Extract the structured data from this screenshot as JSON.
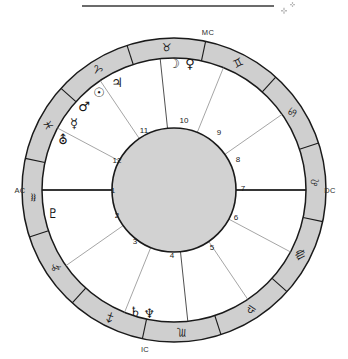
{
  "header": {
    "rule_line": "horizontal-rule",
    "marks": [
      "+",
      "+"
    ]
  },
  "chart_data": {
    "type": "pie",
    "subtitle": "",
    "xlabel": "",
    "ylabel": "",
    "legend_position": "none",
    "grid": false,
    "center": {
      "cx": 174,
      "cy": 190
    },
    "radii": {
      "outer": 152,
      "inner_ring": 132,
      "disc": 62
    },
    "colors": {
      "ring_fill": "#cfcfcf",
      "disc_fill": "#d2d2d2",
      "stroke": "#1a1a1a",
      "cusp": "#3c3c3c",
      "text": "#1a1a1a"
    },
    "categories": [
      "Aries",
      "Taurus",
      "Gemini",
      "Cancer",
      "Leo",
      "Virgo",
      "Libra",
      "Scorpio",
      "Sagittarius",
      "Capricorn",
      "Aquarius",
      "Pisces"
    ],
    "values": [
      30,
      30,
      30,
      30,
      30,
      30,
      30,
      30,
      30,
      30,
      30,
      30
    ],
    "zodiac": [
      {
        "name": "Aries",
        "glyph": "♈",
        "mid_deg": 57,
        "label_r": 142
      },
      {
        "name": "Taurus",
        "glyph": "♉",
        "mid_deg": 87,
        "label_r": 142
      },
      {
        "name": "Gemini",
        "glyph": "♊",
        "mid_deg": 117,
        "label_r": 142
      },
      {
        "name": "Cancer",
        "glyph": "♋",
        "mid_deg": 147,
        "label_r": 142
      },
      {
        "name": "Leo",
        "glyph": "♌",
        "mid_deg": 177,
        "label_r": 142
      },
      {
        "name": "Virgo",
        "glyph": "♍",
        "mid_deg": 207,
        "label_r": 142
      },
      {
        "name": "Libra",
        "glyph": "♎",
        "mid_deg": 237,
        "label_r": 142
      },
      {
        "name": "Scorpio",
        "glyph": "♏",
        "mid_deg": 267,
        "label_r": 142
      },
      {
        "name": "Sagittarius",
        "glyph": "♐",
        "mid_deg": 297,
        "label_r": 142
      },
      {
        "name": "Capricorn",
        "glyph": "♑",
        "mid_deg": 327,
        "label_r": 142
      },
      {
        "name": "Aquarius",
        "glyph": "♒",
        "mid_deg": 357,
        "label_r": 142
      },
      {
        "name": "Pisces",
        "glyph": "♓",
        "mid_deg": 27,
        "label_r": 142
      }
    ],
    "sign_boundaries_deg": [
      12,
      42,
      72,
      102,
      132,
      162,
      192,
      222,
      252,
      282,
      312,
      342
    ],
    "planets": [
      {
        "name": "Moon",
        "glyph": "☽",
        "x": 174,
        "y": 64
      },
      {
        "name": "Venus",
        "glyph": "♀",
        "x": 190,
        "y": 64
      },
      {
        "name": "Jupiter",
        "glyph": "♃",
        "x": 117,
        "y": 83
      },
      {
        "name": "Sun",
        "glyph": "☉",
        "x": 99,
        "y": 93
      },
      {
        "name": "Mars",
        "glyph": "♂",
        "x": 84,
        "y": 107
      },
      {
        "name": "Mercury",
        "glyph": "☿",
        "x": 74,
        "y": 124
      },
      {
        "name": "Uranus",
        "glyph": "⛢",
        "x": 63,
        "y": 140
      },
      {
        "name": "Pluto",
        "glyph": "♇",
        "x": 53,
        "y": 214
      },
      {
        "name": "Saturn",
        "glyph": "♄",
        "x": 135,
        "y": 312
      },
      {
        "name": "Neptune",
        "glyph": "♆",
        "x": 149,
        "y": 314
      }
    ],
    "houses": [
      {
        "number": "1",
        "x": 113,
        "y": 191
      },
      {
        "number": "2",
        "x": 117,
        "y": 216
      },
      {
        "number": "3",
        "x": 135,
        "y": 242
      },
      {
        "number": "4",
        "x": 172,
        "y": 256
      },
      {
        "number": "5",
        "x": 212,
        "y": 248
      },
      {
        "number": "6",
        "x": 236,
        "y": 218
      },
      {
        "number": "7",
        "x": 243,
        "y": 189
      },
      {
        "number": "8",
        "x": 238,
        "y": 160
      },
      {
        "number": "9",
        "x": 219,
        "y": 133
      },
      {
        "number": "10",
        "x": 184,
        "y": 121
      },
      {
        "number": "11",
        "x": 144,
        "y": 131
      },
      {
        "number": "12",
        "x": 117,
        "y": 161
      }
    ],
    "angles": [
      {
        "name": "MC",
        "label": "MC",
        "x": 208,
        "y": 33
      },
      {
        "name": "AC",
        "label": "AC",
        "x": 20,
        "y": 191
      },
      {
        "name": "DC",
        "label": "DC",
        "x": 330,
        "y": 191
      },
      {
        "name": "IC",
        "label": "IC",
        "x": 145,
        "y": 350
      }
    ],
    "annotations": [
      "MC at top (Midheaven)",
      "AC at left (Ascendant)",
      "DC at right (Descendant)",
      "IC at bottom (Imum Coeli)"
    ]
  }
}
